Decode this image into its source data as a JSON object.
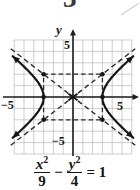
{
  "page": {
    "number_partial": "3"
  },
  "graph": {
    "axis_label_y": "y",
    "tick_top": "5",
    "tick_bottom": "−5",
    "tick_left": "−5",
    "tick_right": "5"
  },
  "equation": {
    "numerator_1": "x",
    "exp_1": "2",
    "denominator_1": "9",
    "operator": "−",
    "numerator_2": "y",
    "exp_2": "2",
    "denominator_2": "4",
    "rhs": "= 1"
  },
  "colors": {
    "curve": "#161616",
    "axis": "#1d1d1d",
    "grid": "#b8b8b8",
    "dashed": "#2a2a2a",
    "background": "#ffffff",
    "artifact": "#cfcfcf"
  },
  "chart_data": {
    "type": "line",
    "curve": "hyperbola",
    "equation": "x²/9 − y²/4 = 1",
    "a": 3,
    "b": 2,
    "orientation": "opens-left-right",
    "center": [
      0,
      0
    ],
    "vertices": [
      [
        -3,
        0
      ],
      [
        3,
        0
      ]
    ],
    "marked_points": [
      [
        -3,
        0
      ],
      [
        3,
        0
      ],
      [
        -3,
        2
      ],
      [
        3,
        2
      ],
      [
        -3,
        -2
      ],
      [
        3,
        -2
      ]
    ],
    "asymptote_slope": 0.6667,
    "asymptotes": [
      "y = (2/3)x",
      "y = −(2/3)x"
    ],
    "central_box": {
      "x": [
        -3,
        3
      ],
      "y": [
        -2,
        2
      ],
      "style": "dashed"
    },
    "xlim": [
      -6,
      6
    ],
    "ylim": [
      -5,
      5
    ],
    "x_ticks_labeled": [
      -5,
      5
    ],
    "y_ticks_labeled": [
      -5,
      5
    ],
    "grid": true,
    "ylabel": "y",
    "arrows_on_branches": true
  }
}
